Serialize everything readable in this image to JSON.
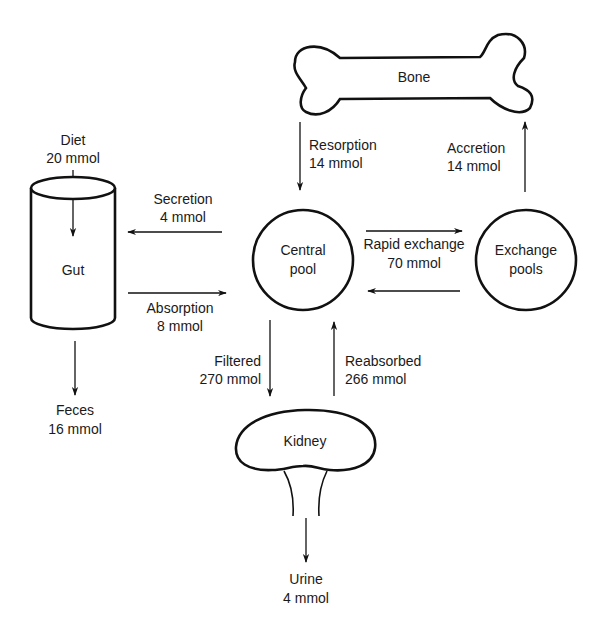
{
  "diagram": {
    "nodes": {
      "bone": {
        "label": "Bone"
      },
      "gut": {
        "label": "Gut"
      },
      "central_pool": {
        "line1": "Central",
        "line2": "pool"
      },
      "exchange_pools": {
        "line1": "Exchange",
        "line2": "pools"
      },
      "kidney": {
        "label": "Kidney"
      }
    },
    "flows": {
      "diet": {
        "name": "Diet",
        "amount": "20 mmol"
      },
      "secretion": {
        "name": "Secretion",
        "amount": "4 mmol"
      },
      "absorption": {
        "name": "Absorption",
        "amount": "8 mmol"
      },
      "feces": {
        "name": "Feces",
        "amount": "16 mmol"
      },
      "resorption": {
        "name": "Resorption",
        "amount": "14 mmol"
      },
      "accretion": {
        "name": "Accretion",
        "amount": "14 mmol"
      },
      "rapid_exchange": {
        "name": "Rapid exchange",
        "amount": "70 mmol"
      },
      "filtered": {
        "name": "Filtered",
        "amount": "270 mmol"
      },
      "reabsorbed": {
        "name": "Reabsorbed",
        "amount": "266 mmol"
      },
      "urine": {
        "name": "Urine",
        "amount": "4 mmol"
      }
    }
  }
}
